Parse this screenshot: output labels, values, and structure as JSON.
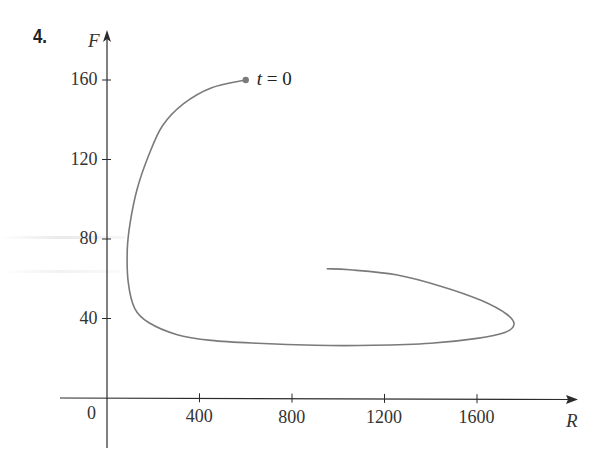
{
  "problem_number": "4.",
  "chart_data": {
    "type": "line",
    "title": "",
    "xlabel": "R",
    "ylabel": "F",
    "xlim": [
      0,
      1900
    ],
    "ylim": [
      0,
      170
    ],
    "grid": false,
    "x_ticks": [
      400,
      800,
      1200,
      1600
    ],
    "y_ticks": [
      40,
      80,
      120,
      160
    ],
    "x_tick_labels": [
      "400",
      "800",
      "1200",
      "1600"
    ],
    "y_tick_labels": [
      "40",
      "80",
      "120",
      "160"
    ],
    "origin_label": "0",
    "annotations": [
      {
        "text_var": "t",
        "text_rest": " = 0",
        "x": 600,
        "y": 160,
        "marker": "dot"
      }
    ],
    "series": [
      {
        "name": "phase trajectory (R, F)",
        "color": "#7a7a7a",
        "points": [
          [
            600,
            160
          ],
          [
            450,
            156
          ],
          [
            330,
            148
          ],
          [
            240,
            137
          ],
          [
            180,
            122
          ],
          [
            130,
            105
          ],
          [
            100,
            88
          ],
          [
            88,
            75
          ],
          [
            92,
            58
          ],
          [
            120,
            45
          ],
          [
            180,
            38
          ],
          [
            300,
            32
          ],
          [
            450,
            29
          ],
          [
            650,
            27.5
          ],
          [
            900,
            26.5
          ],
          [
            1150,
            26.5
          ],
          [
            1400,
            27.5
          ],
          [
            1600,
            30
          ],
          [
            1720,
            33
          ],
          [
            1760,
            37
          ],
          [
            1730,
            42
          ],
          [
            1620,
            49
          ],
          [
            1450,
            56
          ],
          [
            1250,
            62
          ],
          [
            1050,
            64.5
          ],
          [
            950,
            65
          ]
        ]
      }
    ]
  },
  "colors": {
    "axis": "#2b2b2b",
    "curve": "#7a7a7a",
    "dot": "#7a7a7a",
    "text": "#333333"
  }
}
